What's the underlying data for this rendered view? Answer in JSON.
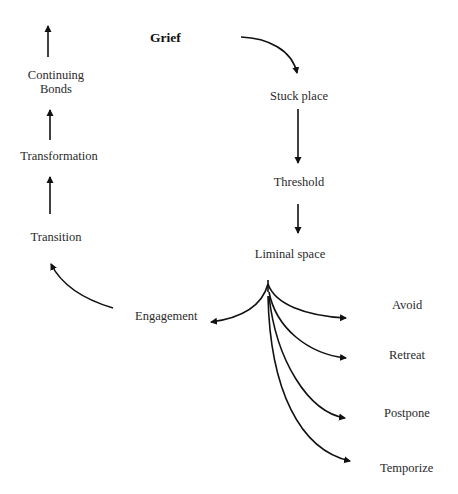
{
  "diagram": {
    "type": "grief process flow",
    "start": "Grief",
    "main_path": [
      "Grief",
      "Stuck place",
      "Threshold",
      "Liminal space"
    ],
    "branch_from": "Liminal space",
    "branches": {
      "left": "Engagement",
      "right": [
        "Avoid",
        "Retreat",
        "Postpone",
        "Temporize"
      ]
    },
    "return_path": [
      "Engagement",
      "Transition",
      "Transformation",
      "Continuing Bonds"
    ],
    "arrow_color": "#111111"
  },
  "nodes": {
    "grief": "Grief",
    "stuck_place": "Stuck place",
    "threshold": "Threshold",
    "liminal_space": "Liminal space",
    "engagement": "Engagement",
    "avoid": "Avoid",
    "retreat": "Retreat",
    "postpone": "Postpone",
    "temporize": "Temporize",
    "transition": "Transition",
    "transformation": "Transformation",
    "continuing_bonds_line1": "Continuing",
    "continuing_bonds_line2": "Bonds"
  }
}
